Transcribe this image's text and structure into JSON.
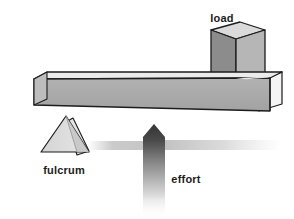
{
  "diagram": {
    "background_color": "#ffffff",
    "labels": {
      "load": "load",
      "fulcrum": "fulcrum",
      "effort": "effort"
    },
    "label_color": "#1c1c1c",
    "parts": {
      "beam": {
        "name": "lever beam",
        "top_face_color": "#e9e9e9",
        "front_face_color": "#a9a9a9",
        "end_cap_color": "#f2f2f2",
        "right_side_color": "#c9c9c9",
        "outline_color": "#1c1c1c"
      },
      "load_block": {
        "name": "load block",
        "top_face_color": "#d8d8d8",
        "front_face_color": "#8b8b8b",
        "right_face_color": "#b4b4b4",
        "outline_color": "#1c1c1c"
      },
      "fulcrum": {
        "name": "fulcrum wedge",
        "left_face_color": "#dcdcdc",
        "right_face_color": "#c4c4c4",
        "side_face_color": "#e4e4e4",
        "outline_color": "#1c1c1c"
      },
      "effort_arrow": {
        "name": "effort arrow",
        "direction": "up",
        "gradient_top_color": "#3a3a3a",
        "gradient_bottom_color": "#d2d2d2"
      },
      "ground_shadow": {
        "name": "ground shadow band",
        "color": "#b9b9b9"
      }
    }
  }
}
